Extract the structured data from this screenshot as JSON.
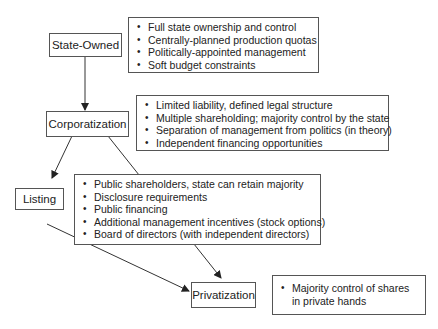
{
  "diagram": {
    "stages": [
      {
        "id": "state-owned",
        "label": "State-Owned"
      },
      {
        "id": "corporatization",
        "label": "Corporatization"
      },
      {
        "id": "listing",
        "label": "Listing"
      },
      {
        "id": "privatization",
        "label": "Privatization"
      }
    ],
    "characteristics": {
      "state_owned": [
        "Full state ownership and control",
        "Centrally-planned production quotas",
        "Politically-appointed management",
        "Soft budget constraints"
      ],
      "corporatization": [
        "Limited liability, defined legal structure",
        "Multiple shareholding; majority control by the state",
        "Separation of management from politics (in theory)",
        "Independent financing opportunities"
      ],
      "listing": [
        "Public shareholders, state can retain majority",
        "Disclosure requirements",
        "Public financing",
        "Additional management incentives (stock options)",
        "Board of directors (with independent directors)"
      ],
      "privatization": [
        "Majority control of shares in private hands"
      ]
    },
    "edges": [
      {
        "from": "State-Owned",
        "to": "Corporatization"
      },
      {
        "from": "Corporatization",
        "to": "Listing"
      },
      {
        "from": "Corporatization",
        "to": "Privatization"
      },
      {
        "from": "Listing",
        "to": "Privatization"
      }
    ]
  }
}
